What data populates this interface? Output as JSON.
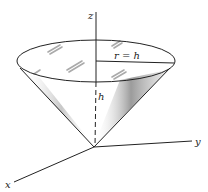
{
  "diagram": {
    "type": "3d-cone",
    "labels": {
      "z_axis": "z",
      "y_axis": "y",
      "x_axis": "x",
      "radius": "r = h",
      "height": "h"
    },
    "colors": {
      "stroke": "#222222",
      "shading": "#8a8a8a",
      "background": "#ffffff"
    }
  }
}
